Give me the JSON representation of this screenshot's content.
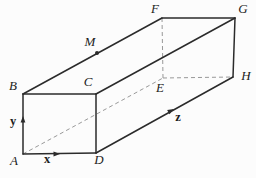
{
  "figure": {
    "width": 256,
    "height": 178,
    "colors": {
      "background": "#fcfcfc",
      "solid_line": "#2b2b2b",
      "dashed_line": "#999999",
      "label_text": "#1c1c1c"
    },
    "diagram": {
      "vertices": {
        "A": {
          "label": "A",
          "x": 23,
          "y": 154,
          "label_x": 14,
          "label_y": 162
        },
        "B": {
          "label": "B",
          "x": 23,
          "y": 94,
          "label_x": 13,
          "label_y": 87
        },
        "C": {
          "label": "C",
          "x": 96,
          "y": 94,
          "label_x": 88,
          "label_y": 83
        },
        "D": {
          "label": "D",
          "x": 96,
          "y": 153,
          "label_x": 99,
          "label_y": 161
        },
        "E": {
          "label": "E",
          "x": 163,
          "y": 78,
          "label_x": 160,
          "label_y": 89
        },
        "F": {
          "label": "F",
          "x": 162,
          "y": 18,
          "label_x": 155,
          "label_y": 10
        },
        "G": {
          "label": "G",
          "x": 235,
          "y": 18,
          "label_x": 243,
          "label_y": 10
        },
        "H": {
          "label": "H",
          "x": 233,
          "y": 77,
          "label_x": 246,
          "label_y": 77
        }
      },
      "solid_edges": [
        [
          "A",
          "B"
        ],
        [
          "B",
          "C"
        ],
        [
          "C",
          "D"
        ],
        [
          "A",
          "D"
        ],
        [
          "B",
          "F"
        ],
        [
          "C",
          "G"
        ],
        [
          "D",
          "H"
        ],
        [
          "F",
          "G"
        ],
        [
          "G",
          "H"
        ]
      ],
      "dashed_edges": [
        [
          "A",
          "E"
        ],
        [
          "E",
          "F"
        ],
        [
          "E",
          "H"
        ]
      ],
      "marked_points": [
        {
          "label": "M",
          "x": 97,
          "y": 53,
          "label_x": 90,
          "label_y": 43,
          "dot_radius": 2
        }
      ],
      "axes": [
        {
          "name": "x-axis",
          "label": "x",
          "tip_x": 60,
          "tip_y": 154,
          "dir_x": 1,
          "dir_y": 0,
          "label_x": 47,
          "label_y": 160
        },
        {
          "name": "y-axis",
          "label": "y",
          "tip_x": 23,
          "tip_y": 116,
          "dir_x": 0,
          "dir_y": -1,
          "label_x": 13,
          "label_y": 122
        },
        {
          "name": "z-axis",
          "label": "z",
          "tip_x": 174,
          "tip_y": 109,
          "dir_x": 0.874,
          "dir_y": -0.485,
          "label_x": 178,
          "label_y": 118
        }
      ],
      "arrowhead": {
        "length": 6.5,
        "half_width": 2.4
      },
      "line_widths": {
        "solid": 1.5,
        "dashed": 1,
        "dash_pattern": "4 3"
      }
    }
  }
}
